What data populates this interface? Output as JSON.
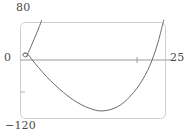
{
  "chart_data": {
    "type": "line",
    "title": "",
    "xlabel": "",
    "ylabel": "",
    "xlim": [
      0,
      25
    ],
    "ylim": [
      -120,
      80
    ],
    "grid": false,
    "legend": null,
    "axis_labels": {
      "y_max": "80",
      "y_zero": "0",
      "y_min": "−120",
      "x_max": "25"
    },
    "xticks": [
      0,
      25
    ],
    "xtick_labels": [
      "0",
      "25"
    ],
    "yticks": [
      -120,
      0,
      80
    ],
    "ytick_labels": [
      "−120",
      "0",
      "80"
    ],
    "x_axis_value": 0,
    "minor_tick_x": 20,
    "minor_tick_y": -60,
    "features": {
      "self_intersection_node": {
        "x": 1.2,
        "y": 11.5
      },
      "parabola_minimum": {
        "x": 13.5,
        "y": -105
      },
      "x_axis_crossings": [
        2.2,
        21.5
      ]
    },
    "series": [
      {
        "name": "main-branch",
        "description": "loop and descending-rising branch",
        "points": [
          [
            0.55,
            14.5
          ],
          [
            0.75,
            16.2
          ],
          [
            1.05,
            16.0
          ],
          [
            1.3,
            13.8
          ],
          [
            1.35,
            11.0
          ],
          [
            1.15,
            9.0
          ],
          [
            0.8,
            8.6
          ],
          [
            0.58,
            10.2
          ],
          [
            0.55,
            12.6
          ],
          [
            0.62,
            14.8
          ],
          [
            0.9,
            16.0
          ],
          [
            1.35,
            13.8
          ],
          [
            2.1,
            2.0
          ],
          [
            3.2,
            -14.0
          ],
          [
            4.5,
            -32.0
          ],
          [
            6.0,
            -50.0
          ],
          [
            7.5,
            -66.0
          ],
          [
            9.0,
            -80.0
          ],
          [
            10.5,
            -91.0
          ],
          [
            12.0,
            -99.0
          ],
          [
            13.5,
            -104.0
          ],
          [
            15.0,
            -103.0
          ],
          [
            16.5,
            -97.0
          ],
          [
            18.0,
            -85.0
          ],
          [
            19.5,
            -66.0
          ],
          [
            20.5,
            -50.0
          ],
          [
            21.5,
            -30.0
          ],
          [
            22.3,
            -10.0
          ],
          [
            23.0,
            12.0
          ],
          [
            23.7,
            38.0
          ],
          [
            24.3,
            66.0
          ],
          [
            24.7,
            85.0
          ]
        ]
      },
      {
        "name": "steep-branch",
        "description": "steep branch exiting top-left",
        "points": [
          [
            1.1,
            9.4
          ],
          [
            1.3,
            14.0
          ],
          [
            1.6,
            22.0
          ],
          [
            2.0,
            33.0
          ],
          [
            2.45,
            46.0
          ],
          [
            2.9,
            59.0
          ],
          [
            3.3,
            71.0
          ],
          [
            3.7,
            84.0
          ]
        ]
      }
    ],
    "style": {
      "curve_color": "#6b6b6b",
      "axis_color": "#9a9a9a",
      "frame_color": "#cfcfcf",
      "label_color": "#4a4a4a",
      "background": "#ffffff"
    }
  }
}
